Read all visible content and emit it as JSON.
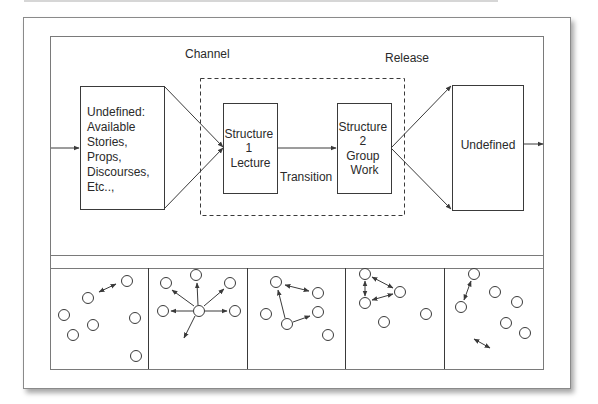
{
  "diagram": {
    "labels": {
      "channel": "Channel",
      "release": "Release",
      "transition": "Transition"
    },
    "left_box": {
      "lines": [
        "Undefined:",
        "Available",
        "Stories,",
        "Props,",
        "Discourses,",
        "Etc..,"
      ]
    },
    "structure1": {
      "lines": [
        "Structure",
        "1",
        "Lecture"
      ]
    },
    "structure2": {
      "lines": [
        "Structure",
        "2",
        "Group",
        "Work"
      ]
    },
    "right_box": {
      "label": "Undefined"
    },
    "panels": [
      {
        "name": "panel-1-scattered",
        "nodes": 7
      },
      {
        "name": "panel-2-hub-lecture",
        "nodes": 6
      },
      {
        "name": "panel-3-partial-links",
        "nodes": 5
      },
      {
        "name": "panel-4-small-group",
        "nodes": 5
      },
      {
        "name": "panel-5-dispersal",
        "nodes": 6
      }
    ],
    "colors": {
      "line": "#3a3a3a",
      "frame": "#7a7a7a",
      "background": "#ffffff"
    }
  }
}
